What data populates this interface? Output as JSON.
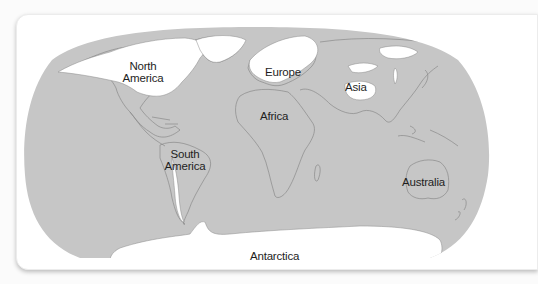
{
  "map": {
    "projection": "Robinson-style world map",
    "colors": {
      "page_background": "#fbfbfb",
      "card_background": "#ffffff",
      "land_ocean_gray": "#c6c6c6",
      "ice_white": "#ffffff",
      "coastline": "#8a8a8a",
      "label_text": "#1e1e1e"
    },
    "labels": {
      "north_america_line1": "North",
      "north_america_line2": "America",
      "europe": "Europe",
      "asia": "Asia",
      "africa": "Africa",
      "south_america_line1": "South",
      "south_america_line2": "America",
      "australia": "Australia",
      "antarctica": "Antarctica"
    }
  }
}
